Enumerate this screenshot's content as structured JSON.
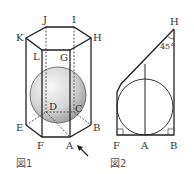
{
  "figure1": {
    "caption": "図1",
    "vertex_labels": {
      "J": "J",
      "I": "I",
      "K": "K",
      "H": "H",
      "L": "L",
      "G": "G",
      "D": "D",
      "C": "C",
      "E": "E",
      "B": "B",
      "F": "F",
      "A": "A"
    },
    "description": "Regular hexagonal prism with inscribed sphere; arrow pointing at vertex A",
    "colors": {
      "line": "#222222",
      "sphere_light": "#f2f2f2",
      "sphere_dark": "#9a9a9a"
    }
  },
  "figure2": {
    "caption": "図2",
    "vertex_labels": {
      "H": "H",
      "F": "F",
      "A": "A",
      "B": "B"
    },
    "angle_label": "45°",
    "description": "Cross-section showing circle tangent to sides, 45° angle at H, right angles at F and B"
  }
}
